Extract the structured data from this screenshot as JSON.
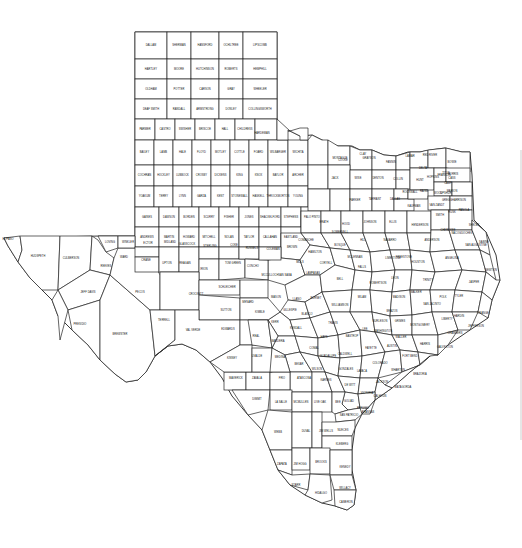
{
  "map": {
    "title": "Texas Counties",
    "colors": {
      "background": "#ffffff",
      "border": "#222222",
      "text": "#111111"
    },
    "panhandle_grid": {
      "origin": [
        135,
        32
      ],
      "col_w": 28.5,
      "row_h": 27,
      "rows": [
        [
          "DALLAM",
          "SHERMAN",
          "HANSFORD",
          "OCHILTREE",
          "LIPSCOMB"
        ],
        [
          "HARTLEY",
          "MOORE",
          "HUTCHINSON",
          "ROBERTS",
          "HEMPHILL"
        ],
        [
          "OLDHAM",
          "POTTER",
          "CARSON",
          "GRAY",
          "WHEELER"
        ],
        [
          "DEAF SMITH",
          "RANDALL",
          "ARMSTRONG",
          "DONLEY",
          "COLLINGSWORTH"
        ],
        [
          "PARMER",
          "CASTRO",
          "SWISHER",
          "BRISCOE",
          "HALL",
          "CHILDRESS"
        ]
      ]
    },
    "south_plains_grid": {
      "origin": [
        135,
        140
      ],
      "col_w": 24.5,
      "row_h": 25,
      "rows": [
        [
          "BAILEY",
          "LAMB",
          "HALE",
          "FLOYD",
          "MOTLEY",
          "COTTLE",
          "FOARD",
          "WILBARGER",
          "WICHITA"
        ],
        [
          "COCHRAN",
          "HOCKLEY",
          "LUBBOCK",
          "CROSBY",
          "DICKENS",
          "KING",
          "KNOX",
          "BAYLOR",
          "ARCHER"
        ],
        [
          "YOAKUM",
          "TERRY",
          "LYNN",
          "GARZA",
          "KENT",
          "STONEWALL",
          "HASKELL",
          "THROCKMORTON",
          "YOUNG"
        ]
      ]
    },
    "rolling_plains_grid": {
      "origin": [
        135,
        215
      ],
      "col_w": 27,
      "row_h": 25,
      "rows": [
        [
          "GAINES",
          "DAWSON",
          "BORDEN",
          "SCURRY",
          "FISHER",
          "JONES",
          "SHACKELFORD",
          "STEPHENS",
          "PALO PINTO"
        ],
        [
          "ANDREWS",
          "MARTIN",
          "HOWARD",
          "MITCHELL",
          "NOLAN",
          "TAYLOR",
          "CALLAHAN",
          "EASTLAND"
        ]
      ]
    },
    "counties": [
      {
        "name": "HARDEMAN",
        "x": 262,
        "y": 133
      },
      {
        "name": "CLAY",
        "x": 363,
        "y": 154
      },
      {
        "name": "MONTAGUE",
        "x": 340,
        "y": 158
      },
      {
        "name": "COOKE",
        "x": 343,
        "y": 160
      },
      {
        "name": "GRAYSON",
        "x": 369,
        "y": 158
      },
      {
        "name": "FANNIN",
        "x": 391,
        "y": 162
      },
      {
        "name": "LAMAR",
        "x": 410,
        "y": 156
      },
      {
        "name": "RED RIVER",
        "x": 430,
        "y": 155
      },
      {
        "name": "BOWIE",
        "x": 452,
        "y": 162
      },
      {
        "name": "JACK",
        "x": 335,
        "y": 178
      },
      {
        "name": "WISE",
        "x": 358,
        "y": 178
      },
      {
        "name": "DENTON",
        "x": 378,
        "y": 178
      },
      {
        "name": "COLLIN",
        "x": 398,
        "y": 179
      },
      {
        "name": "HUNT",
        "x": 420,
        "y": 180
      },
      {
        "name": "DELTA",
        "x": 423,
        "y": 168
      },
      {
        "name": "HOPKINS",
        "x": 433,
        "y": 177
      },
      {
        "name": "FRANKLIN",
        "x": 444,
        "y": 175
      },
      {
        "name": "TITUS",
        "x": 446,
        "y": 173
      },
      {
        "name": "MORRIS",
        "x": 453,
        "y": 174
      },
      {
        "name": "CASS",
        "x": 452,
        "y": 178
      },
      {
        "name": "CAMP",
        "x": 448,
        "y": 183
      },
      {
        "name": "MARION",
        "x": 452,
        "y": 191
      },
      {
        "name": "PARKER",
        "x": 355,
        "y": 200
      },
      {
        "name": "TARRANT",
        "x": 375,
        "y": 199
      },
      {
        "name": "DALLAS",
        "x": 395,
        "y": 199
      },
      {
        "name": "ROCKWALL",
        "x": 410,
        "y": 192
      },
      {
        "name": "KAUFMAN",
        "x": 414,
        "y": 206
      },
      {
        "name": "VAN ZANDT",
        "x": 437,
        "y": 205
      },
      {
        "name": "RAINS",
        "x": 424,
        "y": 191
      },
      {
        "name": "WOOD",
        "x": 438,
        "y": 193
      },
      {
        "name": "UPSHUR",
        "x": 446,
        "y": 193
      },
      {
        "name": "HARRISON",
        "x": 459,
        "y": 200
      },
      {
        "name": "GREGG",
        "x": 447,
        "y": 200
      },
      {
        "name": "SMITH",
        "x": 440,
        "y": 215
      },
      {
        "name": "RUSK",
        "x": 452,
        "y": 212
      },
      {
        "name": "PANOLA",
        "x": 464,
        "y": 210
      },
      {
        "name": "HOOD",
        "x": 346,
        "y": 224
      },
      {
        "name": "JOHNSON",
        "x": 370,
        "y": 222
      },
      {
        "name": "ELLIS",
        "x": 393,
        "y": 222
      },
      {
        "name": "HENDERSON",
        "x": 420,
        "y": 225
      },
      {
        "name": "ANDERSON",
        "x": 432,
        "y": 240
      },
      {
        "name": "CHEROKEE",
        "x": 448,
        "y": 230
      },
      {
        "name": "NACOGDOCHES",
        "x": 462,
        "y": 233
      },
      {
        "name": "SHELBY",
        "x": 474,
        "y": 225
      },
      {
        "name": "SAN AUGUSTINE",
        "x": 476,
        "y": 245
      },
      {
        "name": "SABINE",
        "x": 484,
        "y": 242
      },
      {
        "name": "ERATH",
        "x": 324,
        "y": 222
      },
      {
        "name": "SOMERVELL",
        "x": 340,
        "y": 232
      },
      {
        "name": "COMANCHE",
        "x": 306,
        "y": 240
      },
      {
        "name": "BROWN",
        "x": 292,
        "y": 247
      },
      {
        "name": "HAMILTON",
        "x": 315,
        "y": 252
      },
      {
        "name": "BOSQUE",
        "x": 340,
        "y": 245
      },
      {
        "name": "HILL",
        "x": 363,
        "y": 240
      },
      {
        "name": "NAVARRO",
        "x": 390,
        "y": 240
      },
      {
        "name": "FREESTONE",
        "x": 404,
        "y": 257
      },
      {
        "name": "LIMESTONE",
        "x": 393,
        "y": 258
      },
      {
        "name": "MCLENNAN",
        "x": 355,
        "y": 257
      },
      {
        "name": "CORYELL",
        "x": 326,
        "y": 263
      },
      {
        "name": "MILLS",
        "x": 300,
        "y": 262
      },
      {
        "name": "SAN SABA",
        "x": 285,
        "y": 275
      },
      {
        "name": "LAMPASAS",
        "x": 313,
        "y": 273
      },
      {
        "name": "BELL",
        "x": 340,
        "y": 279
      },
      {
        "name": "FALLS",
        "x": 362,
        "y": 267
      },
      {
        "name": "ROBERTSON",
        "x": 378,
        "y": 283
      },
      {
        "name": "LEON",
        "x": 395,
        "y": 278
      },
      {
        "name": "HOUSTON",
        "x": 418,
        "y": 262
      },
      {
        "name": "TRINITY",
        "x": 428,
        "y": 280
      },
      {
        "name": "ANGELINA",
        "x": 452,
        "y": 258
      },
      {
        "name": "POLK",
        "x": 443,
        "y": 297
      },
      {
        "name": "TYLER",
        "x": 459,
        "y": 296
      },
      {
        "name": "JASPER",
        "x": 474,
        "y": 282
      },
      {
        "name": "NEWTON",
        "x": 491,
        "y": 270
      },
      {
        "name": "MADISON",
        "x": 399,
        "y": 297
      },
      {
        "name": "WALKER",
        "x": 416,
        "y": 292
      },
      {
        "name": "SAN JACINTO",
        "x": 432,
        "y": 304
      },
      {
        "name": "BRAZOS",
        "x": 392,
        "y": 311
      },
      {
        "name": "BURLESON",
        "x": 380,
        "y": 321
      },
      {
        "name": "MILAM",
        "x": 362,
        "y": 297
      },
      {
        "name": "WILLIAMSON",
        "x": 340,
        "y": 305
      },
      {
        "name": "BURNET",
        "x": 316,
        "y": 298
      },
      {
        "name": "LLANO",
        "x": 297,
        "y": 299
      },
      {
        "name": "MASON",
        "x": 276,
        "y": 297
      },
      {
        "name": "MCCULLOCH",
        "x": 270,
        "y": 275
      },
      {
        "name": "GRIMES",
        "x": 400,
        "y": 321
      },
      {
        "name": "MONTGOMERY",
        "x": 420,
        "y": 325
      },
      {
        "name": "LIBERTY",
        "x": 447,
        "y": 319
      },
      {
        "name": "HARDIN",
        "x": 459,
        "y": 316
      },
      {
        "name": "ORANGE",
        "x": 483,
        "y": 313
      },
      {
        "name": "JEFFERSON",
        "x": 476,
        "y": 326
      },
      {
        "name": "CHAMBERS",
        "x": 455,
        "y": 333
      },
      {
        "name": "HARRIS",
        "x": 425,
        "y": 344
      },
      {
        "name": "WALLER",
        "x": 401,
        "y": 337
      },
      {
        "name": "WASHINGTON",
        "x": 383,
        "y": 331
      },
      {
        "name": "LEE",
        "x": 365,
        "y": 329
      },
      {
        "name": "TRAVIS",
        "x": 333,
        "y": 323
      },
      {
        "name": "BLANCO",
        "x": 307,
        "y": 314
      },
      {
        "name": "GILLESPIE",
        "x": 290,
        "y": 310
      },
      {
        "name": "KIMBLE",
        "x": 260,
        "y": 312
      },
      {
        "name": "BASTROP",
        "x": 352,
        "y": 336
      },
      {
        "name": "HAYS",
        "x": 324,
        "y": 337
      },
      {
        "name": "KENDALL",
        "x": 296,
        "y": 328
      },
      {
        "name": "KERR",
        "x": 275,
        "y": 322
      },
      {
        "name": "FAYETTE",
        "x": 371,
        "y": 348
      },
      {
        "name": "AUSTIN",
        "x": 392,
        "y": 346
      },
      {
        "name": "FORT BEND",
        "x": 410,
        "y": 356
      },
      {
        "name": "GALVESTON",
        "x": 445,
        "y": 347
      },
      {
        "name": "BRAZORIA",
        "x": 420,
        "y": 374
      },
      {
        "name": "WHARTON",
        "x": 398,
        "y": 370
      },
      {
        "name": "MATAGORDA",
        "x": 403,
        "y": 387
      },
      {
        "name": "COLORADO",
        "x": 380,
        "y": 363
      },
      {
        "name": "CALDWELL",
        "x": 345,
        "y": 354
      },
      {
        "name": "GUADALUPE",
        "x": 328,
        "y": 356
      },
      {
        "name": "COMAL",
        "x": 314,
        "y": 348
      },
      {
        "name": "BEXAR",
        "x": 299,
        "y": 364
      },
      {
        "name": "BANDERA",
        "x": 278,
        "y": 341
      },
      {
        "name": "REAL",
        "x": 256,
        "y": 336
      },
      {
        "name": "EDWARDS",
        "x": 228,
        "y": 329
      },
      {
        "name": "SUTTON",
        "x": 226,
        "y": 310
      },
      {
        "name": "MENARD",
        "x": 248,
        "y": 302
      },
      {
        "name": "SCHLEICHER",
        "x": 227,
        "y": 287
      },
      {
        "name": "TOM GREEN",
        "x": 233,
        "y": 263
      },
      {
        "name": "CONCHO",
        "x": 253,
        "y": 266
      },
      {
        "name": "COLEMAN",
        "x": 273,
        "y": 249
      },
      {
        "name": "RUNNELS",
        "x": 252,
        "y": 248
      },
      {
        "name": "COKE",
        "x": 234,
        "y": 245
      },
      {
        "name": "STERLING",
        "x": 210,
        "y": 246
      },
      {
        "name": "GLASSCOCK",
        "x": 187,
        "y": 244
      },
      {
        "name": "MIDLAND",
        "x": 170,
        "y": 242
      },
      {
        "name": "ECTOR",
        "x": 148,
        "y": 243
      },
      {
        "name": "WINKLER",
        "x": 128,
        "y": 242
      },
      {
        "name": "LOVING",
        "x": 110,
        "y": 242
      },
      {
        "name": "WARD",
        "x": 124,
        "y": 257
      },
      {
        "name": "CRANE",
        "x": 146,
        "y": 260
      },
      {
        "name": "UPTON",
        "x": 167,
        "y": 263
      },
      {
        "name": "REAGAN",
        "x": 185,
        "y": 263
      },
      {
        "name": "IRION",
        "x": 204,
        "y": 269
      },
      {
        "name": "CROCKETT",
        "x": 196,
        "y": 294
      },
      {
        "name": "REEVES",
        "x": 106,
        "y": 266
      },
      {
        "name": "PECOS",
        "x": 140,
        "y": 292
      },
      {
        "name": "TERRELL",
        "x": 164,
        "y": 320
      },
      {
        "name": "VAL VERDE",
        "x": 193,
        "y": 330
      },
      {
        "name": "KINNEY",
        "x": 232,
        "y": 358
      },
      {
        "name": "UVALDE",
        "x": 257,
        "y": 356
      },
      {
        "name": "MEDINA",
        "x": 280,
        "y": 357
      },
      {
        "name": "MAVERICK",
        "x": 236,
        "y": 378
      },
      {
        "name": "ZAVALA",
        "x": 257,
        "y": 378
      },
      {
        "name": "FRIO",
        "x": 282,
        "y": 378
      },
      {
        "name": "ATASCOSA",
        "x": 304,
        "y": 378
      },
      {
        "name": "WILSON",
        "x": 317,
        "y": 369
      },
      {
        "name": "KARNES",
        "x": 326,
        "y": 380
      },
      {
        "name": "GONZALES",
        "x": 346,
        "y": 369
      },
      {
        "name": "DE WITT",
        "x": 350,
        "y": 385
      },
      {
        "name": "LAVACA",
        "x": 362,
        "y": 371
      },
      {
        "name": "JACKSON",
        "x": 382,
        "y": 382
      },
      {
        "name": "VICTORIA",
        "x": 367,
        "y": 393
      },
      {
        "name": "CALHOUN",
        "x": 380,
        "y": 396
      },
      {
        "name": "GOLIAD",
        "x": 349,
        "y": 401
      },
      {
        "name": "REFUGIO",
        "x": 363,
        "y": 408
      },
      {
        "name": "ARANSAS",
        "x": 368,
        "y": 412
      },
      {
        "name": "BEE",
        "x": 338,
        "y": 402
      },
      {
        "name": "LIVE OAK",
        "x": 320,
        "y": 402
      },
      {
        "name": "MCMULLEN",
        "x": 301,
        "y": 402
      },
      {
        "name": "LA SALLE",
        "x": 281,
        "y": 402
      },
      {
        "name": "DIMMIT",
        "x": 257,
        "y": 399
      },
      {
        "name": "WEBB",
        "x": 278,
        "y": 432
      },
      {
        "name": "DUVAL",
        "x": 306,
        "y": 431
      },
      {
        "name": "JIM WELLS",
        "x": 326,
        "y": 431
      },
      {
        "name": "SAN PATRICIO",
        "x": 349,
        "y": 415
      },
      {
        "name": "NUECES",
        "x": 343,
        "y": 430
      },
      {
        "name": "KLEBERG",
        "x": 342,
        "y": 444
      },
      {
        "name": "ZAPATA",
        "x": 282,
        "y": 464
      },
      {
        "name": "JIM HOGG",
        "x": 300,
        "y": 464
      },
      {
        "name": "BROOKS",
        "x": 321,
        "y": 462
      },
      {
        "name": "KENEDY",
        "x": 345,
        "y": 467
      },
      {
        "name": "STARR",
        "x": 296,
        "y": 485
      },
      {
        "name": "HIDALGO",
        "x": 321,
        "y": 493
      },
      {
        "name": "WILLACY",
        "x": 345,
        "y": 488
      },
      {
        "name": "CAMERON",
        "x": 346,
        "y": 502
      },
      {
        "name": "EL PASO",
        "x": 8,
        "y": 239
      },
      {
        "name": "HUDSPETH",
        "x": 38,
        "y": 256
      },
      {
        "name": "CULBERSON",
        "x": 71,
        "y": 258
      },
      {
        "name": "JEFF DAVIS",
        "x": 88,
        "y": 292
      },
      {
        "name": "PRESIDIO",
        "x": 80,
        "y": 324
      },
      {
        "name": "BREWSTER",
        "x": 120,
        "y": 334
      }
    ]
  }
}
